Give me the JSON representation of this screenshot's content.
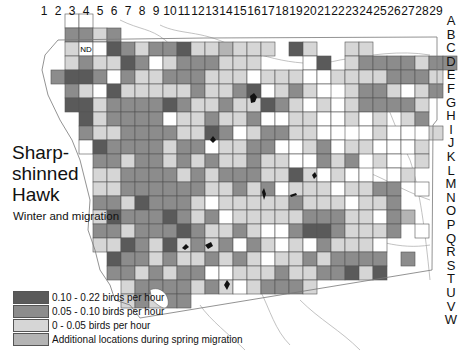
{
  "title": [
    "Sharp-",
    "shinned",
    "Hawk"
  ],
  "subtitle": "Winter and migration",
  "nd_label": "ND",
  "columns": [
    "1",
    "2",
    "3",
    "4",
    "5",
    "6",
    "7",
    "8",
    "9",
    "10",
    "11",
    "12",
    "13",
    "14",
    "15",
    "16",
    "17",
    "18",
    "19",
    "20",
    "21",
    "22",
    "23",
    "24",
    "25",
    "26",
    "27",
    "28",
    "29"
  ],
  "rows": [
    "A",
    "B",
    "C",
    "D",
    "E",
    "F",
    "G",
    "H",
    "I",
    "J",
    "K",
    "L",
    "M",
    "N",
    "O",
    "P",
    "Q",
    "R",
    "S",
    "T",
    "U",
    "V",
    "W"
  ],
  "legend": [
    {
      "label": "0.10 - 0.22 birds per hour",
      "color": "#5a5a5a"
    },
    {
      "label": "0.05 - 0.10 birds per hour",
      "color": "#8c8c8c"
    },
    {
      "label": "0 - 0.05 birds per hour",
      "color": "#d6d6d6"
    },
    {
      "label": "Additional locations during spring migration",
      "color": "#b4b4b4"
    }
  ],
  "colors": {
    "0": "#ffffff",
    "1": "#d6d6d6",
    "2": "#8c8c8c",
    "3": "#5a5a5a",
    "4": "#b4b4b4",
    "grid": "#555555",
    "water": "#111111",
    "road": "#a0a0a0"
  },
  "grid": {
    "origin_x": 37,
    "origin_y": 14,
    "cell": 14,
    "comment_rows": "each string = one row starting col 1; '.'=no cell, 0=surveyed none, 1=low, 2=mid, 3=high, 4=spring",
    "cells": [
      "..00....................",
      "..2212.....................",
      "..1N0321223114111.31..11...",
      "..12113201222111...03.12222122.",
      ".2332021122211101110011112221",
      "..2103111112112301210.1221012.",
      "..33122223211211321010122221.",
      "...3122220112112001100101.12.",
      "...2112222113201221100.0100.1",
      "...0322221220112200120110001",
      "....2212212121121100212.10.1",
      "....11222212122211310100.01",
      "....1122222211212011101122.0",
      "....2213222101111121110112...",
      "....13222321201111122211024",
      "....2212223211210023321112.0",
      "....113213121202101021110..",
      ".....32212112121011212222.2",
      ".....22121220011121122313",
      "......12222121012221",
      "......12122........",
      ".........",
      "........."
    ]
  }
}
